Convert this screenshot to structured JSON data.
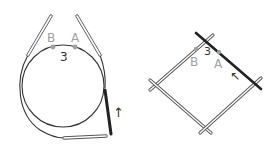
{
  "figures": {
    "circular": {
      "label_a": "A",
      "label_b": "B",
      "round_number": "3",
      "arrow": "↑"
    },
    "dpn": {
      "label_a": "A",
      "label_b": "B",
      "round_number": "3",
      "arrow": "↖"
    }
  },
  "colors": {
    "line": "#333333",
    "needle_outline": "#555555",
    "marker": "#a0a0a0",
    "dark_needle": "#222222"
  }
}
